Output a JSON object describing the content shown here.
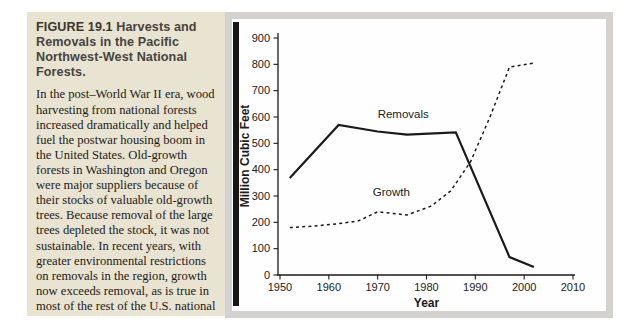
{
  "figure": {
    "label": "FIGURE 19.1",
    "title": "Harvests and Removals in the Pacific Northwest-West National Forests.",
    "caption": "In the post–World War II era, wood harvesting from national forests increased dramatically and helped fuel the postwar housing boom in the United States. Old-growth forests in Washington and Oregon were major suppliers because of their stocks of valuable old-growth trees. Because removal of the large trees depleted the stock, it was not sustainable. In recent years, with greater environmental restrictions on removals in the region, growth now exceeds removal, as is true in most of the rest of the U.S. national forests."
  },
  "chart_data": {
    "type": "line",
    "title": "",
    "xlabel": "Year",
    "ylabel": "Million Cubic Feet",
    "xlim": [
      1950,
      2010
    ],
    "ylim": [
      0,
      900
    ],
    "x_ticks": [
      1950,
      1960,
      1970,
      1980,
      1990,
      2000,
      2010
    ],
    "y_ticks": [
      0,
      100,
      200,
      300,
      400,
      500,
      600,
      700,
      800,
      900
    ],
    "grid": false,
    "legend": "inline-labels",
    "series": [
      {
        "name": "Removals",
        "line_style": "solid",
        "x": [
          1952,
          1962,
          1970,
          1976,
          1986,
          1997,
          2002
        ],
        "values": [
          368,
          570,
          545,
          533,
          542,
          68,
          30
        ],
        "label_at": {
          "x": 1970,
          "y": 595
        }
      },
      {
        "name": "Growth",
        "line_style": "dashed",
        "x": [
          1952,
          1957,
          1962,
          1966,
          1970,
          1976,
          1981,
          1985,
          1989,
          1993,
          1997,
          2002
        ],
        "values": [
          180,
          186,
          195,
          205,
          240,
          228,
          262,
          320,
          430,
          600,
          790,
          805
        ],
        "label_at": {
          "x": 1969,
          "y": 300
        }
      }
    ],
    "line_color": "#1a1a1a"
  },
  "colors": {
    "panel_bg": "#e9e3d1",
    "frame_border": "#d4d2cf",
    "divider_bar": "#161616",
    "title_text": "#45443f",
    "body_text": "#1d1b18"
  }
}
